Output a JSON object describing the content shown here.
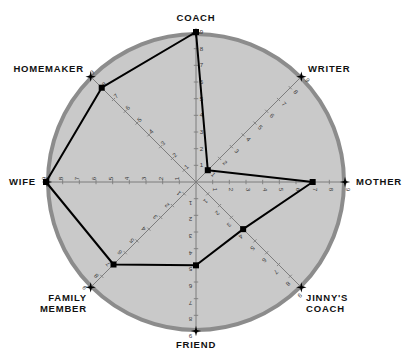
{
  "chart_data": {
    "type": "radar",
    "title": "",
    "subtitle": "",
    "xlabel": "",
    "ylabel": "",
    "scale_min": 0,
    "scale_max": 9,
    "tick_labels": [
      "1",
      "2",
      "3",
      "4",
      "5",
      "6",
      "7",
      "8",
      "9"
    ],
    "grid": false,
    "legend": "none",
    "categories": [
      "COACH",
      "WRITER",
      "MOTHER",
      "JINNY'S COACH",
      "FRIEND",
      "FAMILY MEMBER",
      "WIFE",
      "HOMEMAKER"
    ],
    "values": [
      9,
      1,
      7,
      4,
      5,
      7,
      9,
      8
    ],
    "series": [
      {
        "name": "",
        "values": [
          9,
          1,
          7,
          4,
          5,
          7,
          9,
          8
        ]
      }
    ]
  },
  "axes": [
    {
      "label": "COACH",
      "value": 9,
      "angle_deg": -90,
      "label_anchor": "middle",
      "label_dx": 0,
      "label_dy": -11
    },
    {
      "label": "WRITER",
      "value": 1,
      "angle_deg": -45,
      "label_anchor": "start",
      "label_dx": 6,
      "label_dy": -4
    },
    {
      "label": "MOTHER",
      "value": 7,
      "angle_deg": 0,
      "label_anchor": "start",
      "label_dx": 10,
      "label_dy": 3
    },
    {
      "label": "JINNY'S",
      "value": 4,
      "angle_deg": 45,
      "label_anchor": "start",
      "label_dx": 4,
      "label_dy": 13
    },
    {
      "label": "FRIEND",
      "value": 5,
      "angle_deg": 90,
      "label_anchor": "middle",
      "label_dx": 0,
      "label_dy": 16
    },
    {
      "label": "FAMILY",
      "value": 7,
      "angle_deg": 135,
      "label_anchor": "end",
      "label_dx": -3,
      "label_dy": 13
    },
    {
      "label": "WIFE",
      "value": 9,
      "angle_deg": 180,
      "label_anchor": "end",
      "label_dx": -10,
      "label_dy": 3
    },
    {
      "label": "HOMEMAKER",
      "value": 8,
      "angle_deg": -135,
      "label_anchor": "end",
      "label_dx": -6,
      "label_dy": -4
    }
  ],
  "label_second_lines": {
    "jinnys_coach": "COACH",
    "family_member": "MEMBER"
  },
  "colors": {
    "disc_fill": "#c9c9c9",
    "disc_border": "#8c8c8c",
    "axis_line": "#7d7d7d",
    "data_line": "#000000",
    "marker_fill": "#000000",
    "star": "#000000",
    "label_text": "#111111",
    "tick_text": "#3a3a3a",
    "background": "#ffffff"
  },
  "geometry": {
    "center_x": 196,
    "center_y": 182,
    "radius": 150,
    "border_width": 4
  }
}
